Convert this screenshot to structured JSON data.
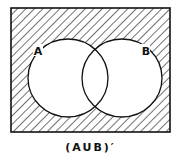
{
  "diagram": {
    "type": "venn",
    "sets": [
      {
        "label": "A"
      },
      {
        "label": "B"
      }
    ],
    "shaded_region": "complement of A union B",
    "caption": "(AUB)′",
    "colors": {
      "line": "#111111",
      "background": "#ffffff"
    }
  }
}
